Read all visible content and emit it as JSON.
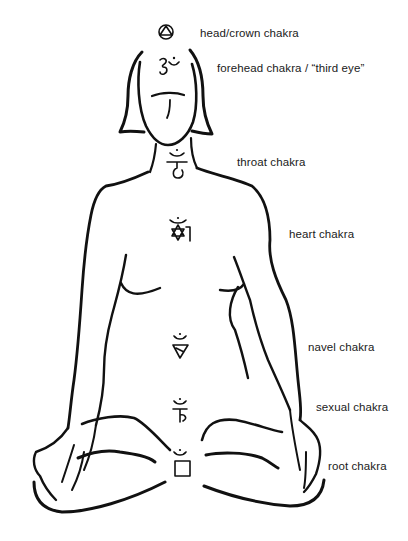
{
  "diagram": {
    "line_color": "#111111",
    "background": "#ffffff",
    "labels": [
      {
        "id": "crown",
        "text": "head/crown chakra",
        "x": 200,
        "y": 27
      },
      {
        "id": "forehead",
        "text": "forehead chakra / “third eye”",
        "x": 217,
        "y": 62
      },
      {
        "id": "throat",
        "text": "throat chakra",
        "x": 237,
        "y": 156
      },
      {
        "id": "heart",
        "text": "heart chakra",
        "x": 289,
        "y": 228
      },
      {
        "id": "navel",
        "text": "navel chakra",
        "x": 308,
        "y": 341
      },
      {
        "id": "sexual",
        "text": "sexual chakra",
        "x": 316,
        "y": 401
      },
      {
        "id": "root",
        "text": "root chakra",
        "x": 328,
        "y": 460
      }
    ],
    "symbols": [
      {
        "id": "crown",
        "icon": "circle-triangle-icon",
        "cx": 166,
        "cy": 32
      },
      {
        "id": "forehead",
        "icon": "om-icon",
        "cx": 167,
        "cy": 67
      },
      {
        "id": "throat",
        "icon": "ham-bija-icon",
        "cx": 177,
        "cy": 163
      },
      {
        "id": "heart",
        "icon": "hexagram-yam-icon",
        "cx": 180,
        "cy": 230
      },
      {
        "id": "navel",
        "icon": "ram-triangle-icon",
        "cx": 181,
        "cy": 348
      },
      {
        "id": "sexual",
        "icon": "vam-bija-icon",
        "cx": 180,
        "cy": 415
      },
      {
        "id": "root",
        "icon": "square-lam-icon",
        "cx": 180,
        "cy": 464
      }
    ]
  }
}
